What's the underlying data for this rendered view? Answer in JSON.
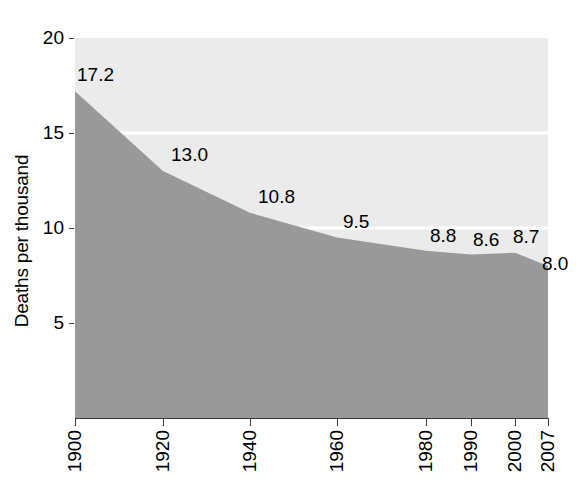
{
  "chart_data": {
    "type": "area",
    "title": "",
    "subtitle": "",
    "xlabel": "",
    "ylabel": "Deaths per thousand",
    "categories": [
      "1900",
      "1920",
      "1940",
      "1960",
      "1980",
      "1990",
      "2000",
      "2007"
    ],
    "x": [
      1900,
      1920,
      1940,
      1960,
      1980,
      1990,
      2000,
      2007
    ],
    "values": [
      17.2,
      13.0,
      10.8,
      9.5,
      8.8,
      8.6,
      8.7,
      8.0
    ],
    "data_labels": [
      "17.2",
      "13.0",
      "10.8",
      "9.5",
      "8.8",
      "8.6",
      "8.7",
      "8.0"
    ],
    "ylim": [
      0,
      20
    ],
    "y_ticks": [
      5,
      10,
      15,
      20
    ],
    "y_tick_labels": [
      "5",
      "10",
      "15",
      "20"
    ],
    "grid": true,
    "grid_color": "#ffffff",
    "legend": "none",
    "panel_color": "#ebebeb",
    "area_color": "#999999",
    "axis_color": "#3a3a3a",
    "text_color": "#000000"
  },
  "axes": {
    "y_title": "Deaths per thousand",
    "y_ticks": [
      {
        "label": "20",
        "value": 20
      },
      {
        "label": "15",
        "value": 15
      },
      {
        "label": "10",
        "value": 10
      },
      {
        "label": "5",
        "value": 5
      }
    ],
    "x_ticks": [
      {
        "label": "1900",
        "value": 1900
      },
      {
        "label": "1920",
        "value": 1920
      },
      {
        "label": "1940",
        "value": 1940
      },
      {
        "label": "1960",
        "value": 1960
      },
      {
        "label": "1980",
        "value": 1980
      },
      {
        "label": "1990",
        "value": 1990
      },
      {
        "label": "2000",
        "value": 2000
      },
      {
        "label": "2007",
        "value": 2007
      }
    ]
  },
  "labels": [
    {
      "text": "17.2"
    },
    {
      "text": "13.0"
    },
    {
      "text": "10.8"
    },
    {
      "text": "9.5"
    },
    {
      "text": "8.8"
    },
    {
      "text": "8.6"
    },
    {
      "text": "8.7"
    },
    {
      "text": "8.0"
    }
  ]
}
